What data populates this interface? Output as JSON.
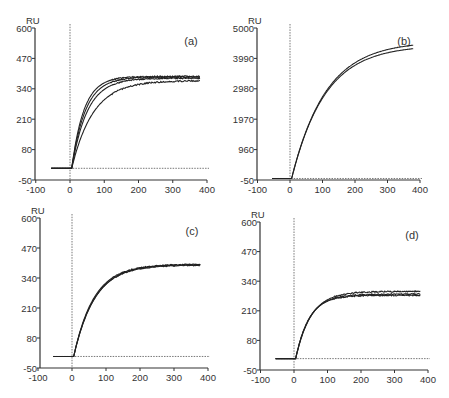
{
  "figure": {
    "panels_label": [
      "(a)",
      "(b)",
      "(c)",
      "(d)"
    ]
  },
  "chart_data": [
    {
      "type": "line",
      "panel": "(a)",
      "ylabel": "RU",
      "xlabel": "",
      "xlim": [
        -100,
        400
      ],
      "ylim": [
        -50,
        600
      ],
      "xticks": [
        -100,
        0,
        100,
        200,
        300,
        400
      ],
      "yticks": [
        -50,
        80,
        210,
        340,
        470,
        600
      ],
      "injection_marker_x": 0,
      "baseline_y": 0,
      "series": [
        {
          "name": "curve 1",
          "plateau": 393,
          "rate": 0.028,
          "x_start": -55,
          "x_end": 380
        },
        {
          "name": "curve 2",
          "plateau": 390,
          "rate": 0.025,
          "x_start": -55,
          "x_end": 380
        },
        {
          "name": "curve 3",
          "plateau": 385,
          "rate": 0.022,
          "x_start": -55,
          "x_end": 380
        },
        {
          "name": "curve 4",
          "plateau": 375,
          "rate": 0.016,
          "x_start": -55,
          "x_end": 380
        }
      ],
      "layout": {
        "x0": 35,
        "y_top": 28,
        "y_bot": 180,
        "x_zero": 70,
        "x_400": 207
      }
    },
    {
      "type": "line",
      "panel": "(b)",
      "ylabel": "RU",
      "xlabel": "",
      "xlim": [
        -100,
        400
      ],
      "ylim": [
        -50,
        5000
      ],
      "xticks": [
        -100,
        0,
        100,
        200,
        300,
        400
      ],
      "yticks": [
        -50,
        960,
        1970,
        2980,
        3990,
        5000
      ],
      "injection_marker_x": 0,
      "baseline_y": 0,
      "series": [
        {
          "name": "curve 1",
          "plateau": 4560,
          "rate": 0.0095,
          "x_start": -55,
          "x_end": 380
        },
        {
          "name": "curve 2",
          "plateau": 4430,
          "rate": 0.0097,
          "x_start": -55,
          "x_end": 380
        }
      ],
      "layout": {
        "x0": 257,
        "y_top": 28,
        "y_bot": 180,
        "x_zero": 290,
        "x_400": 420
      }
    },
    {
      "type": "line",
      "panel": "(c)",
      "ylabel": "RU",
      "xlabel": "",
      "xlim": [
        -100,
        400
      ],
      "ylim": [
        -50,
        600
      ],
      "xticks": [
        -100,
        0,
        100,
        200,
        300,
        400
      ],
      "yticks": [
        -50,
        80,
        210,
        340,
        470,
        600
      ],
      "injection_marker_x": 0,
      "baseline_y": 0,
      "series": [
        {
          "name": "curve 1",
          "plateau": 398,
          "rate": 0.017,
          "x_start": -55,
          "x_end": 378
        },
        {
          "name": "curve 2",
          "plateau": 400,
          "rate": 0.016,
          "x_start": -55,
          "x_end": 378
        },
        {
          "name": "curve 3",
          "plateau": 396,
          "rate": 0.0165,
          "x_start": -55,
          "x_end": 378
        }
      ],
      "layout": {
        "x0": 40,
        "y_top": 218,
        "y_bot": 368,
        "x_zero": 72,
        "x_400": 208
      }
    },
    {
      "type": "line",
      "panel": "(d)",
      "ylabel": "RU",
      "xlabel": "",
      "xlim": [
        -100,
        400
      ],
      "ylim": [
        -50,
        600
      ],
      "xticks": [
        -100,
        0,
        100,
        200,
        300,
        400
      ],
      "yticks": [
        -50,
        80,
        210,
        340,
        470,
        600
      ],
      "injection_marker_x": 0,
      "baseline_y": 0,
      "series": [
        {
          "name": "curve 1",
          "plateau": 295,
          "rate": 0.022,
          "x_start": -55,
          "x_end": 378
        },
        {
          "name": "curve 2",
          "plateau": 283,
          "rate": 0.024,
          "x_start": -55,
          "x_end": 378
        },
        {
          "name": "curve 3",
          "plateau": 278,
          "rate": 0.025,
          "x_start": -55,
          "x_end": 378
        }
      ],
      "layout": {
        "x0": 260,
        "y_top": 222,
        "y_bot": 370,
        "x_zero": 294,
        "x_400": 428
      }
    }
  ]
}
